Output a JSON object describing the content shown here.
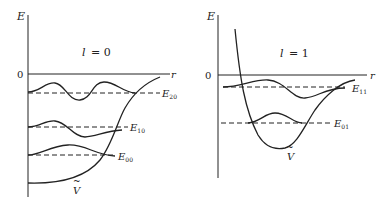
{
  "left_panel": {
    "axis_y_label": "E",
    "axis_x_label": "r",
    "zero_label": "0",
    "title_var": "l",
    "title_eq": "= 0",
    "potential_label": "V",
    "potential_tilde": "~",
    "levels": [
      {
        "name": "E",
        "sub": "20"
      },
      {
        "name": "E",
        "sub": "10"
      },
      {
        "name": "E",
        "sub": "00"
      }
    ]
  },
  "right_panel": {
    "axis_y_label": "E",
    "axis_x_label": "r",
    "zero_label": "0",
    "title_var": "l",
    "title_eq": "= 1",
    "potential_label": "V",
    "potential_tilde": "~",
    "levels": [
      {
        "name": "E",
        "sub": "11"
      },
      {
        "name": "E",
        "sub": "01"
      }
    ]
  }
}
